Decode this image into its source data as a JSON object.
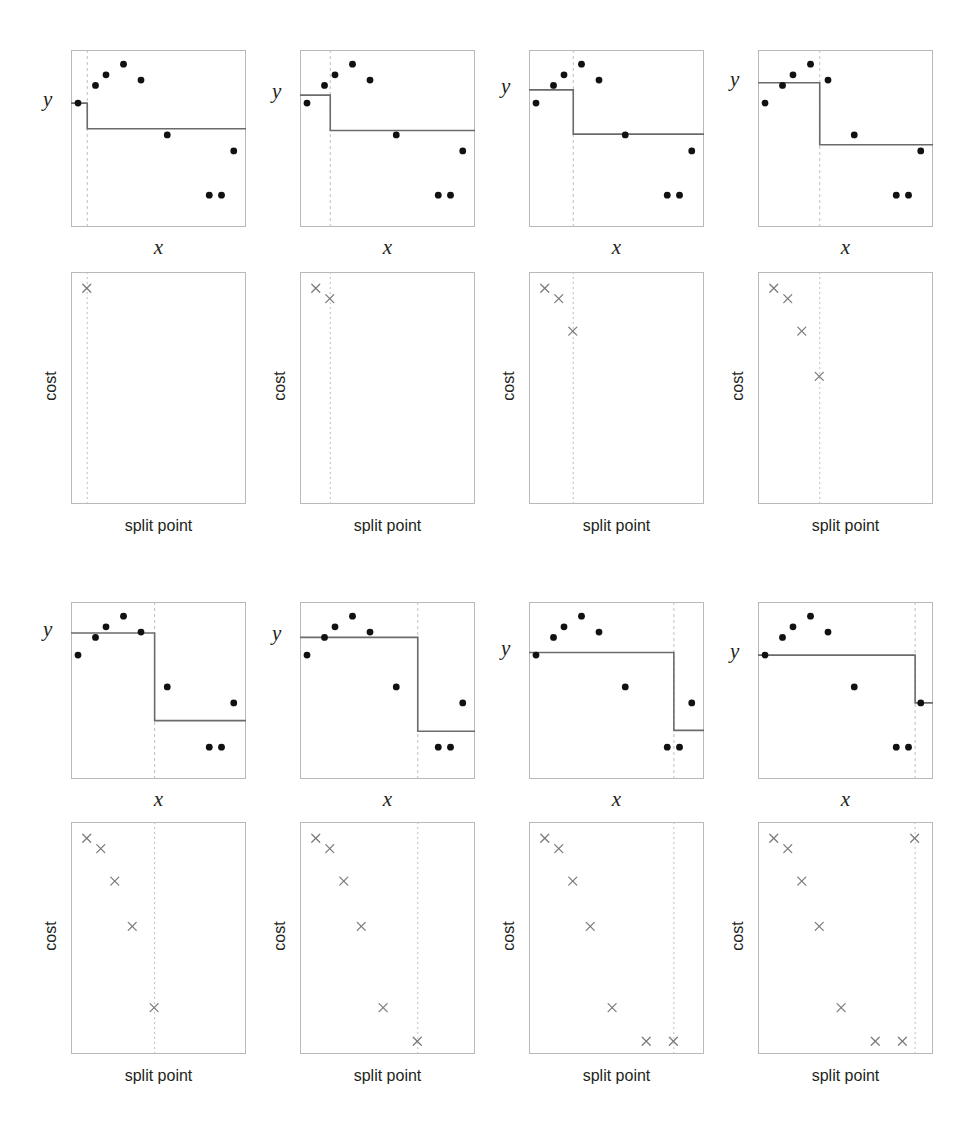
{
  "figure": {
    "background": "#ffffff",
    "axis_color": "#b9b9b9",
    "step_color": "#6b6b6b",
    "point_color": "#111111",
    "marker_color": "#7a7a7a",
    "split_line_color": "#bfbfbf"
  },
  "labels": {
    "y": "y",
    "x": "x",
    "cost": "cost",
    "split_point": "split point"
  },
  "chart_data": {
    "type": "scatter",
    "n_steps": 8,
    "xlim": [
      0,
      1
    ],
    "ylim": [
      0,
      1
    ],
    "grid": false,
    "legend": null,
    "scatter": {
      "xlabel": "x",
      "ylabel": "y",
      "x": [
        0.04,
        0.14,
        0.2,
        0.3,
        0.4,
        0.55,
        0.79,
        0.86,
        0.93
      ],
      "y": [
        0.7,
        0.8,
        0.86,
        0.92,
        0.83,
        0.52,
        0.18,
        0.18,
        0.43
      ]
    },
    "cost_plot": {
      "xlabel": "split point",
      "ylabel": "cost",
      "xlim": [
        0,
        1
      ],
      "ylim": [
        0,
        1
      ],
      "split_points": [
        0.09,
        0.17,
        0.25,
        0.35,
        0.475,
        0.67,
        0.825,
        0.895
      ],
      "costs": [
        0.93,
        0.885,
        0.745,
        0.55,
        0.2,
        0.055,
        0.055,
        0.93
      ]
    },
    "panels": [
      {
        "index": 1,
        "split_point": 0.09,
        "left_mean": 0.7,
        "right_mean": 0.555,
        "cost": 0.93,
        "cost_points_shown": 1
      },
      {
        "index": 2,
        "split_point": 0.17,
        "left_mean": 0.745,
        "right_mean": 0.545,
        "cost": 0.885,
        "cost_points_shown": 2
      },
      {
        "index": 3,
        "split_point": 0.25,
        "left_mean": 0.775,
        "right_mean": 0.525,
        "cost": 0.745,
        "cost_points_shown": 3
      },
      {
        "index": 4,
        "split_point": 0.35,
        "left_mean": 0.815,
        "right_mean": 0.465,
        "cost": 0.55,
        "cost_points_shown": 4
      },
      {
        "index": 5,
        "split_point": 0.475,
        "left_mean": 0.825,
        "right_mean": 0.33,
        "cost": 0.2,
        "cost_points_shown": 5
      },
      {
        "index": 6,
        "split_point": 0.67,
        "left_mean": 0.8,
        "right_mean": 0.27,
        "cost": 0.055,
        "cost_points_shown": 6
      },
      {
        "index": 7,
        "split_point": 0.825,
        "left_mean": 0.715,
        "right_mean": 0.275,
        "cost": 0.055,
        "cost_points_shown": 7
      },
      {
        "index": 8,
        "split_point": 0.895,
        "left_mean": 0.7,
        "right_mean": 0.43,
        "cost": 0.93,
        "cost_points_shown": 8
      }
    ]
  }
}
